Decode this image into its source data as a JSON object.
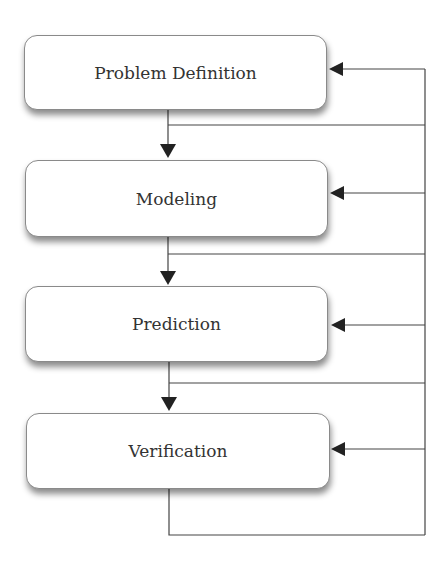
{
  "diagram": {
    "type": "flowchart",
    "boxes": [
      {
        "label": "Problem Definition"
      },
      {
        "label": "Modeling"
      },
      {
        "label": "Prediction"
      },
      {
        "label": "Verification"
      }
    ],
    "edges": [
      {
        "from": "Problem Definition",
        "to": "Modeling"
      },
      {
        "from": "Modeling",
        "to": "Prediction"
      },
      {
        "from": "Prediction",
        "to": "Verification"
      },
      {
        "from": "Verification",
        "to": "feedback-bus"
      },
      {
        "from": "feedback-bus",
        "to": "Problem Definition"
      },
      {
        "from": "feedback-bus",
        "to": "Modeling"
      },
      {
        "from": "feedback-bus",
        "to": "Prediction"
      },
      {
        "from": "feedback-bus",
        "to": "Verification"
      }
    ],
    "colors": {
      "line": "#333333",
      "box_border": "#8a8a8a",
      "text": "#333333"
    }
  }
}
